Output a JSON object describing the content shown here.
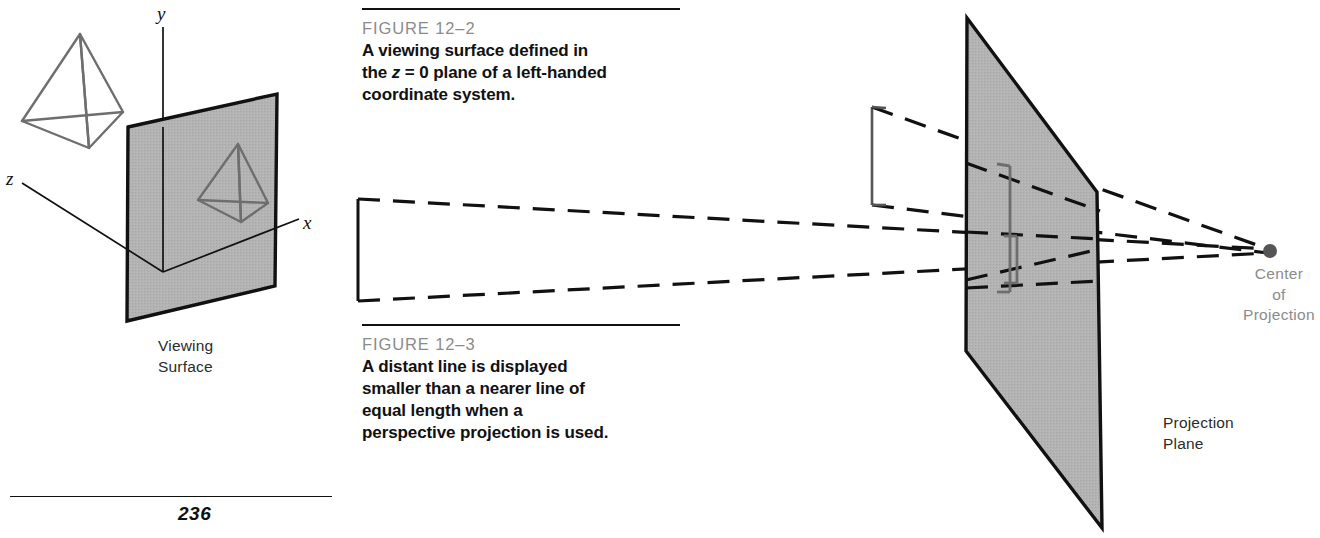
{
  "page": {
    "number": "236",
    "background_color": "#ffffff"
  },
  "colors": {
    "rule": "#111111",
    "figure_label": "#8b8b8b",
    "caption_text": "#111111",
    "plane_fill": "#b0b0b0",
    "plane_stroke": "#111111",
    "pyramid_stroke": "#6e6e6e",
    "dashed_line": "#111111",
    "center_dot": "#555555",
    "axis_line": "#111111"
  },
  "figures": [
    {
      "id": "figure-12-2",
      "label": "FIGURE  12–2",
      "caption_lines": [
        "A viewing surface defined in",
        "the z = 0 plane of a left-handed",
        "coordinate system."
      ],
      "caption_plain": "A viewing surface defined in the z = 0 plane of a left-handed coordinate system.",
      "diagram": {
        "axes": [
          {
            "name": "y-axis",
            "label": "y"
          },
          {
            "name": "z-axis",
            "label": "z"
          },
          {
            "name": "x-axis",
            "label": "x"
          }
        ],
        "plane_label": "Viewing\nSurface",
        "objects": [
          {
            "name": "pyramid-3d",
            "description": "wireframe tetrahedron in space"
          },
          {
            "name": "pyramid-projected",
            "description": "wireframe tetrahedron drawn on viewing surface"
          }
        ]
      }
    },
    {
      "id": "figure-12-3",
      "label": "FIGURE  12–3",
      "caption_lines": [
        "A distant line is displayed",
        "smaller than a nearer line of",
        "equal length when a",
        "perspective projection is used."
      ],
      "caption_plain": "A distant line is displayed smaller than a nearer line of equal length when a perspective projection is used.",
      "diagram": {
        "plane_label": "Projection\nPlane",
        "center_label": "Center\nof\nProjection",
        "objects": [
          {
            "name": "near-line",
            "description": "tall vertical line close to viewer"
          },
          {
            "name": "far-line",
            "description": "vertical line far from viewer, same real length"
          },
          {
            "name": "near-line-projection",
            "description": "taller image on projection plane"
          },
          {
            "name": "far-line-projection",
            "description": "shorter image on projection plane"
          },
          {
            "name": "projector-rays",
            "description": "dashed rays converging at center of projection"
          }
        ]
      }
    }
  ]
}
